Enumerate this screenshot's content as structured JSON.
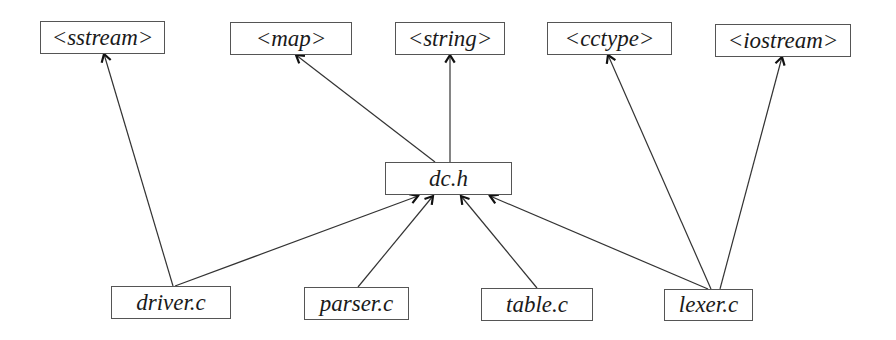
{
  "diagram": {
    "type": "include-dependency-graph",
    "nodes": [
      {
        "id": "sstream",
        "label": "<sstream>",
        "x": 40,
        "y": 21,
        "w": 125,
        "h": 33
      },
      {
        "id": "map",
        "label": "<map>",
        "x": 230,
        "y": 22,
        "w": 122,
        "h": 33
      },
      {
        "id": "string",
        "label": "<string>",
        "x": 395,
        "y": 22,
        "w": 110,
        "h": 33
      },
      {
        "id": "cctype",
        "label": "<cctype>",
        "x": 547,
        "y": 22,
        "w": 125,
        "h": 33
      },
      {
        "id": "iostream",
        "label": "<iostream>",
        "x": 715,
        "y": 24,
        "w": 136,
        "h": 33
      },
      {
        "id": "dch",
        "label": "dc.h",
        "x": 385,
        "y": 162,
        "w": 127,
        "h": 33
      },
      {
        "id": "driver",
        "label": "driver.c",
        "x": 111,
        "y": 286,
        "w": 120,
        "h": 33
      },
      {
        "id": "parser",
        "label": "parser.c",
        "x": 304,
        "y": 287,
        "w": 105,
        "h": 33
      },
      {
        "id": "table",
        "label": "table.c",
        "x": 481,
        "y": 288,
        "w": 112,
        "h": 33
      },
      {
        "id": "lexer",
        "label": "lexer.c",
        "x": 664,
        "y": 289,
        "w": 89,
        "h": 32
      }
    ],
    "edges": [
      {
        "from": "driver",
        "to": "sstream",
        "x1": 173,
        "y1": 286,
        "x2": 104,
        "y2": 54
      },
      {
        "from": "dch",
        "to": "map",
        "x1": 435,
        "y1": 162,
        "x2": 296,
        "y2": 55
      },
      {
        "from": "dch",
        "to": "string",
        "x1": 450,
        "y1": 162,
        "x2": 450,
        "y2": 55
      },
      {
        "from": "lexer",
        "to": "cctype",
        "x1": 711,
        "y1": 289,
        "x2": 608,
        "y2": 55
      },
      {
        "from": "lexer",
        "to": "iostream",
        "x1": 720,
        "y1": 289,
        "x2": 782,
        "y2": 57
      },
      {
        "from": "driver",
        "to": "dch",
        "x1": 175,
        "y1": 286,
        "x2": 418,
        "y2": 196
      },
      {
        "from": "parser",
        "to": "dch",
        "x1": 358,
        "y1": 287,
        "x2": 433,
        "y2": 196
      },
      {
        "from": "table",
        "to": "dch",
        "x1": 537,
        "y1": 288,
        "x2": 461,
        "y2": 196
      },
      {
        "from": "lexer",
        "to": "dch",
        "x1": 708,
        "y1": 289,
        "x2": 490,
        "y2": 196
      }
    ]
  }
}
